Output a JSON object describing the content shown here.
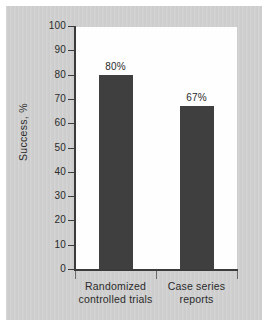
{
  "chart_data": {
    "type": "bar",
    "title": "",
    "xlabel": "",
    "ylabel": "Success, %",
    "ylim": [
      0,
      100
    ],
    "grid": false,
    "legend": "none",
    "categories": [
      "Randomized controlled trials",
      "Case series reports"
    ],
    "category_lines": [
      [
        "Randomized",
        "controlled trials"
      ],
      [
        "Case series",
        "reports"
      ]
    ],
    "values": [
      80,
      67
    ],
    "data_labels": [
      "80%",
      "67%"
    ],
    "y_ticks": [
      100,
      90,
      80,
      70,
      60,
      50,
      40,
      30,
      20,
      10,
      0
    ],
    "y_tick_labels": [
      "100",
      "90",
      "80",
      "70",
      "60",
      "50",
      "40",
      "30",
      "20",
      "10",
      "0"
    ],
    "colors": {
      "bar": "#3f3f3f",
      "axis": "#3b3b3b",
      "plot_background": "#fefefe",
      "panel_background": "#cdcdcd",
      "text": "#2b2b2b"
    }
  }
}
